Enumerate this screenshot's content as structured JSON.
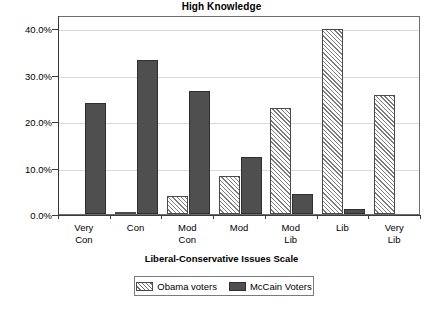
{
  "chart_data": {
    "type": "bar",
    "title": "High Knowledge",
    "xlabel": "Liberal-Conservative Issues Scale",
    "ylabel": "",
    "categories": [
      "Very Con",
      "Con",
      "Mod Con",
      "Mod",
      "Mod Lib",
      "Lib",
      "Very Lib"
    ],
    "category_lines": [
      {
        "line1": "Very",
        "line2": "Con"
      },
      {
        "line1": "Con",
        "line2": ""
      },
      {
        "line1": "Mod",
        "line2": "Con"
      },
      {
        "line1": "Mod",
        "line2": ""
      },
      {
        "line1": "Mod",
        "line2": "Lib"
      },
      {
        "line1": "Lib",
        "line2": ""
      },
      {
        "line1": "Very",
        "line2": "Lib"
      }
    ],
    "series": [
      {
        "name": "Obama voters",
        "fill": "diagonal-hatch",
        "color": "#ffffff",
        "values": [
          0.0,
          0.5,
          3.8,
          8.2,
          22.9,
          39.7,
          25.5
        ]
      },
      {
        "name": "McCain Voters",
        "fill": "solid",
        "color": "#4f4f4f",
        "values": [
          23.8,
          33.1,
          26.5,
          12.2,
          4.2,
          1.0,
          0.0
        ]
      }
    ],
    "ylim": [
      0,
      42.8
    ],
    "yticks": [
      0,
      10,
      20,
      30,
      40
    ],
    "ytick_labels": [
      "0.0%",
      "10.0%",
      "20.0%",
      "30.0%",
      "40.0%"
    ],
    "grid": true,
    "grid_axis": "y",
    "legend_position": "bottom"
  },
  "legend": {
    "entries": [
      {
        "label": "Obama voters"
      },
      {
        "label": "McCain Voters"
      }
    ]
  }
}
